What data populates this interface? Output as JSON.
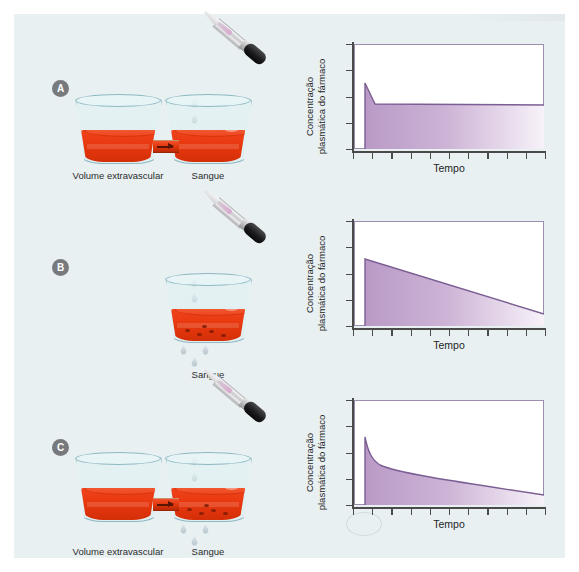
{
  "figure": {
    "background_color": "#e8f0f2",
    "panels": [
      {
        "id": "A",
        "letter": "A",
        "captions": [
          {
            "name": "extravascular",
            "text": "Volume\nextravascular"
          },
          {
            "name": "blood",
            "text": "Sangue"
          }
        ],
        "has_extravascular_beaker": true,
        "has_elimination_drops": false,
        "chart": {
          "ylabel": "Concentração\nplasmática do fármaco",
          "xlabel": "Tempo"
        }
      },
      {
        "id": "B",
        "letter": "B",
        "captions": [
          {
            "name": "blood",
            "text": "Sangue"
          }
        ],
        "has_extravascular_beaker": false,
        "has_elimination_drops": true,
        "chart": {
          "ylabel": "Concentração\nplasmática do fármaco",
          "xlabel": "Tempo"
        }
      },
      {
        "id": "C",
        "letter": "C",
        "captions": [
          {
            "name": "extravascular",
            "text": "Volume\nextravascular"
          },
          {
            "name": "blood",
            "text": "Sangue"
          }
        ],
        "has_extravascular_beaker": true,
        "has_elimination_drops": true,
        "chart": {
          "ylabel": "Concentração\nplasmática do fármaco",
          "xlabel": "Tempo"
        }
      }
    ]
  },
  "colors": {
    "panel_background": "#e8f0f2",
    "blood_red": "#e8380f",
    "glass_outline": "#8fb9c2",
    "curve_purple": "#7b5e93",
    "fill_purple": "#c9aed2",
    "badge_gray": "#77797c",
    "axis_black": "#4a4a4a"
  },
  "chart_data": [
    {
      "type": "area",
      "panel": "A",
      "title": "",
      "xlabel": "Tempo",
      "ylabel": "Concentração plasmática do fármaco",
      "xlim": [
        0,
        10
      ],
      "ylim": [
        0,
        1
      ],
      "grid": false,
      "legend": "none",
      "x_tick_count": 11,
      "y_tick_count": 5,
      "description": "Dose única intravenosa com distribuição extravascular e sem eliminação: pico imediato, queda rápida de distribuição e depois platô constante.",
      "series": [
        {
          "name": "Concentração plasmática",
          "x": [
            0.6,
            0.6,
            1.0,
            1.5,
            2.0,
            3.0,
            4.0,
            5.0,
            6.0,
            7.0,
            8.0,
            9.0,
            10.0
          ],
          "y": [
            0.0,
            0.62,
            0.42,
            0.38,
            0.375,
            0.375,
            0.374,
            0.374,
            0.373,
            0.373,
            0.372,
            0.372,
            0.372
          ]
        }
      ]
    },
    {
      "type": "area",
      "panel": "B",
      "title": "",
      "xlabel": "Tempo",
      "ylabel": "Concentração plasmática do fármaco",
      "xlim": [
        0,
        10
      ],
      "ylim": [
        0,
        1
      ],
      "grid": false,
      "legend": "none",
      "x_tick_count": 11,
      "y_tick_count": 5,
      "description": "Dose única intravenosa com eliminação e sem distribuição extravascular: pico imediato seguido de declínio linear único.",
      "series": [
        {
          "name": "Concentração plasmática",
          "x": [
            0.6,
            0.6,
            2.0,
            4.0,
            6.0,
            8.0,
            10.0
          ],
          "y": [
            0.0,
            0.63,
            0.545,
            0.435,
            0.325,
            0.215,
            0.11
          ]
        }
      ]
    },
    {
      "type": "area",
      "panel": "C",
      "title": "",
      "xlabel": "Tempo",
      "ylabel": "Concentração plasmática do fármaco",
      "xlim": [
        0,
        10
      ],
      "ylim": [
        0,
        1
      ],
      "grid": false,
      "legend": "none",
      "x_tick_count": 11,
      "y_tick_count": 5,
      "description": "Dose única intravenosa com distribuição extravascular e eliminação: curva biexponencial com fase de distribuição rápida seguida de fase de eliminação lenta.",
      "series": [
        {
          "name": "Concentração plasmática",
          "x": [
            0.6,
            0.6,
            0.9,
            1.3,
            1.8,
            2.5,
            3.5,
            4.5,
            5.5,
            6.5,
            7.5,
            8.5,
            10.0
          ],
          "y": [
            0.0,
            0.64,
            0.5,
            0.41,
            0.355,
            0.325,
            0.295,
            0.265,
            0.235,
            0.205,
            0.175,
            0.145,
            0.095
          ]
        }
      ]
    }
  ]
}
